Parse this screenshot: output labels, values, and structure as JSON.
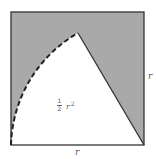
{
  "diagram": {
    "square": {
      "x": 11,
      "y": 12,
      "size": 133,
      "stroke": "#333333"
    },
    "shaded_region": {
      "fill": "#a9a9a9"
    },
    "sector": {
      "center": {
        "x": 144,
        "y": 145
      },
      "radius": 133,
      "peak": {
        "x": 78,
        "y": 33
      },
      "start": {
        "x": 11,
        "y": 145
      },
      "arc_style": "dashed",
      "fill": "#ffffff"
    },
    "labels": {
      "area_numerator": "1",
      "area_denominator": "2",
      "area_var": "r",
      "area_exp": "2",
      "side_right": "r",
      "side_bottom": "r"
    }
  }
}
